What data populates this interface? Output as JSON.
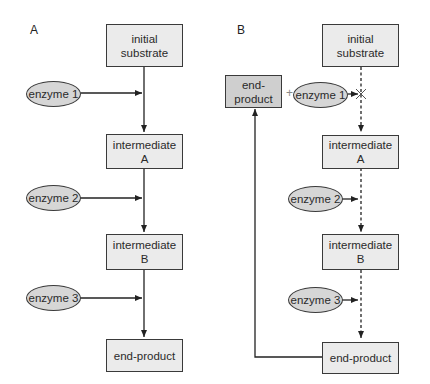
{
  "panels": [
    {
      "label": "A",
      "boxes": [
        "initial\nsubstrate",
        "intermediate\nA",
        "intermediate\nB",
        "end-product"
      ],
      "enzymes": [
        "enzyme 1",
        "enzyme 2",
        "enzyme 3"
      ],
      "pathway_style": "solid"
    },
    {
      "label": "B",
      "boxes": [
        "initial\nsubstrate",
        "intermediate\nA",
        "intermediate\nB",
        "end-product"
      ],
      "enzymes": [
        "enzyme 1",
        "enzyme 2",
        "enzyme 3"
      ],
      "pathway_style": "dashed",
      "feedback": {
        "box": "end-\nproduct",
        "plus": "+",
        "blocked_step": "enzyme 1"
      }
    }
  ],
  "colors": {
    "box_fill": "#ebebeb",
    "enzyme_fill": "#d6d6d6",
    "feedback_box_fill": "#cfcfcf",
    "stroke": "#3a3a3a"
  }
}
